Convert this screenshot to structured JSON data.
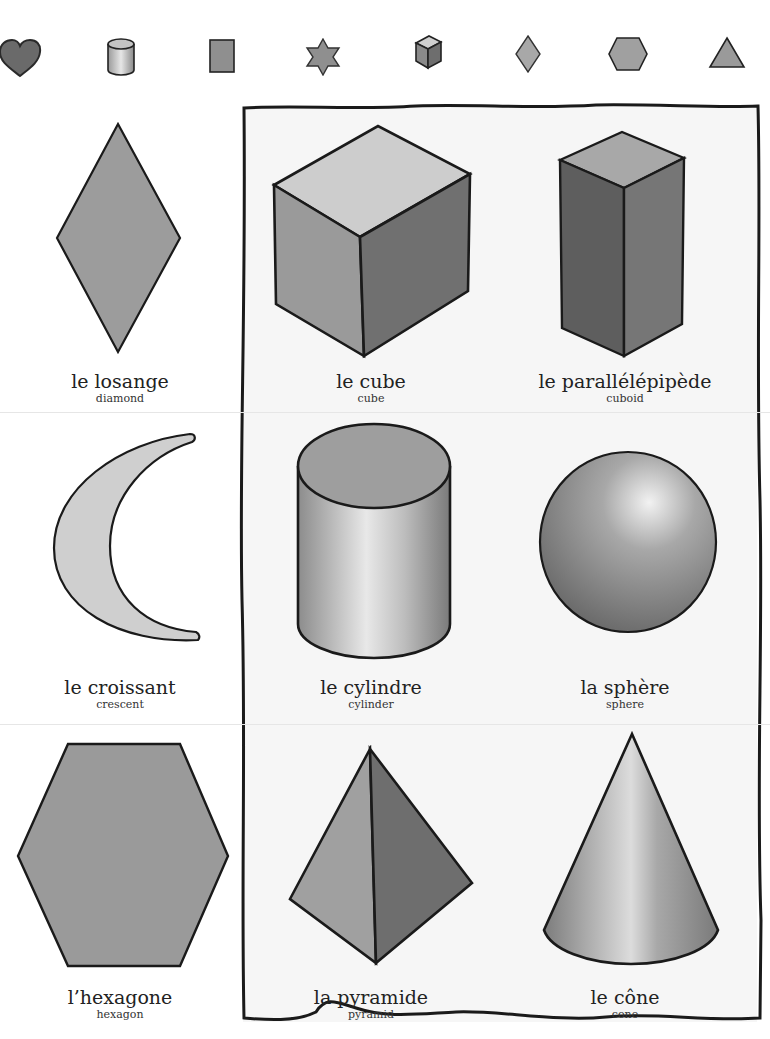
{
  "top_icons": [
    {
      "name": "heart",
      "icon": "heart-icon"
    },
    {
      "name": "cylinder",
      "icon": "cylinder-icon"
    },
    {
      "name": "rectangle",
      "icon": "rectangle-icon"
    },
    {
      "name": "star",
      "icon": "star-icon"
    },
    {
      "name": "cube",
      "icon": "cube-icon"
    },
    {
      "name": "diamond",
      "icon": "diamond-icon"
    },
    {
      "name": "hexagon",
      "icon": "hexagon-icon"
    },
    {
      "name": "triangle",
      "icon": "triangle-icon"
    }
  ],
  "shapes": [
    {
      "french": "le losange",
      "english": "diamond"
    },
    {
      "french": "le cube",
      "english": "cube"
    },
    {
      "french": "le parallélépipède",
      "english": "cuboid"
    },
    {
      "french": "le croissant",
      "english": "crescent"
    },
    {
      "french": "le cylindre",
      "english": "cylinder"
    },
    {
      "french": "la sphère",
      "english": "sphere"
    },
    {
      "french": "l’hexagone",
      "english": "hexagon"
    },
    {
      "french": "la pyramide",
      "english": "pyramid"
    },
    {
      "french": "le cône",
      "english": "cone"
    }
  ],
  "colors": {
    "fill_mid": "#8f8f8f",
    "fill_light": "#c9c9c9",
    "fill_dark": "#6e6e6e",
    "outline": "#1a1a1a",
    "panel_bg": "#f6f6f6"
  }
}
